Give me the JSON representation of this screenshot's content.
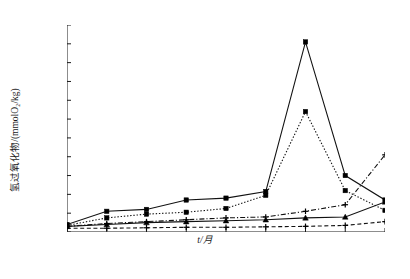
{
  "chart_data": {
    "type": "line",
    "title": "",
    "xlabel": "t/月",
    "ylabel": "氢过氧化物/(mmolO₂/kg)",
    "x": [
      0,
      2,
      3,
      4,
      5,
      6,
      8,
      12,
      15
    ],
    "xticks": [
      "0",
      "2",
      "3",
      "4",
      "5",
      "6",
      "8",
      "12",
      "15"
    ],
    "yticks": [
      "0",
      "2",
      "4",
      "6",
      "8",
      "10",
      "12",
      "14",
      "16",
      "18",
      "20",
      "22"
    ],
    "ylim": [
      0,
      22
    ],
    "grid": false,
    "legend": "none",
    "series": [
      {
        "name": "series-solid-square",
        "style": "solid",
        "marker": "square",
        "values": [
          0.8,
          2.2,
          2.4,
          3.4,
          3.6,
          4.3,
          20.2,
          6.0,
          3.4
        ]
      },
      {
        "name": "series-dotted-square",
        "style": "dotted",
        "marker": "square",
        "values": [
          0.7,
          1.5,
          1.9,
          2.1,
          2.5,
          3.9,
          12.8,
          4.4,
          2.3
        ]
      },
      {
        "name": "series-solid-triangle",
        "style": "solid",
        "marker": "triangle",
        "values": [
          0.6,
          0.8,
          1.0,
          1.1,
          1.2,
          1.3,
          1.5,
          1.6,
          3.2
        ]
      },
      {
        "name": "series-dashdot-plus",
        "style": "dashdot",
        "marker": "plus",
        "values": [
          0.6,
          0.9,
          1.1,
          1.3,
          1.5,
          1.6,
          2.2,
          2.9,
          8.2
        ]
      },
      {
        "name": "series-dashed-plus",
        "style": "dashed",
        "marker": "plus",
        "values": [
          0.4,
          0.4,
          0.45,
          0.5,
          0.5,
          0.55,
          0.6,
          0.7,
          1.1
        ]
      }
    ],
    "colors": {
      "axis": "#1a1a1a",
      "line": "#111111",
      "marker": "#000000"
    }
  }
}
